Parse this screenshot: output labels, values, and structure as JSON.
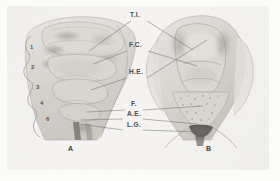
{
  "plate": {
    "background_color": "#f4f3f1",
    "border_color": "#e3e2df",
    "ink_color": "#4a4845"
  },
  "figures": [
    {
      "id": "A",
      "label": "A",
      "caption": "A",
      "view": "lateral"
    },
    {
      "id": "B",
      "label": "B",
      "caption": "B",
      "view": "anteroposterior"
    }
  ],
  "abbreviation_labels": [
    {
      "key": "ti",
      "text": "T.I."
    },
    {
      "key": "fc",
      "text": "F.C."
    },
    {
      "key": "he",
      "text": "H.E."
    },
    {
      "key": "f",
      "text": "F."
    },
    {
      "key": "ae",
      "text": "A.E."
    },
    {
      "key": "lg",
      "text": "L.G."
    }
  ],
  "numbered_labels": [
    {
      "key": "n1",
      "text": "1"
    },
    {
      "key": "n2",
      "text": "2"
    },
    {
      "key": "n3",
      "text": "3"
    },
    {
      "key": "n4",
      "text": "4"
    },
    {
      "key": "n6",
      "text": "6"
    }
  ]
}
